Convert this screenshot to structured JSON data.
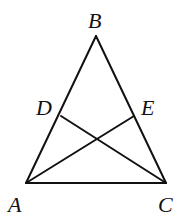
{
  "diagram": {
    "type": "geometry-triangle",
    "points": {
      "A": {
        "label": "A",
        "x": 26,
        "y": 183,
        "lx": 8,
        "ly": 212
      },
      "B": {
        "label": "B",
        "x": 96,
        "y": 36,
        "lx": 88,
        "ly": 28
      },
      "C": {
        "label": "C",
        "x": 166,
        "y": 183,
        "lx": 158,
        "ly": 212
      },
      "D": {
        "label": "D",
        "x": 61,
        "y": 116,
        "lx": 36,
        "ly": 115
      },
      "E": {
        "label": "E",
        "x": 134,
        "y": 116,
        "lx": 141,
        "ly": 115
      }
    },
    "segments": [
      {
        "from": "A",
        "to": "B"
      },
      {
        "from": "B",
        "to": "C"
      },
      {
        "from": "A",
        "to": "C"
      },
      {
        "from": "D",
        "to": "C"
      },
      {
        "from": "A",
        "to": "E"
      }
    ],
    "stroke_color": "#111111",
    "background": "#ffffff"
  }
}
